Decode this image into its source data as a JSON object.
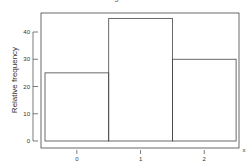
{
  "chart_data": {
    "type": "bar",
    "title": "Figure 1.3",
    "xlabel": "x",
    "ylabel": "Relative frequency",
    "categories": [
      "0",
      "1",
      "2"
    ],
    "values": [
      25,
      45,
      30
    ],
    "ylim": [
      0,
      48
    ],
    "yticks": [
      0,
      10,
      20,
      30,
      40
    ],
    "xticks": [
      "0",
      "1",
      "2"
    ],
    "grid": false,
    "legend": null
  }
}
